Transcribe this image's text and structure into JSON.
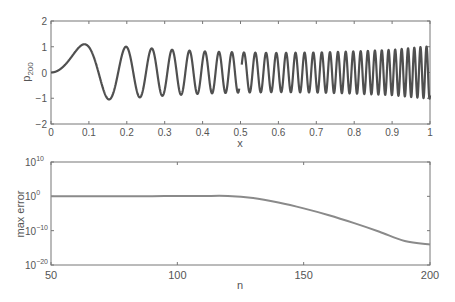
{
  "chart_data": [
    {
      "type": "line",
      "title": "",
      "xlabel": "x",
      "ylabel": "p",
      "ylabel_subscript": "200",
      "xlim": [
        0,
        1
      ],
      "ylim": [
        -2,
        2
      ],
      "grid": false,
      "xticks": [
        "0",
        "0.1",
        "0.2",
        "0.3",
        "0.4",
        "0.5",
        "0.6",
        "0.7",
        "0.8",
        "0.9",
        "1"
      ],
      "yticks": [
        "-2",
        "-1",
        "0",
        "1",
        "2"
      ],
      "series": [
        {
          "name": "p_200",
          "description": "oscillatory function, approx A(x)*sin(200 x^2), small gap near x=0.5",
          "phase_coefficient": 200,
          "envelope": {
            "x": [
              0,
              0.085,
              0.15,
              0.2,
              0.3,
              0.4,
              0.5,
              0.6,
              0.7,
              0.8,
              0.9,
              0.97,
              1.0
            ],
            "amplitude": [
              1.1,
              1.1,
              1.05,
              1.0,
              0.9,
              0.82,
              0.78,
              0.76,
              0.78,
              0.82,
              0.88,
              0.98,
              1.02
            ]
          },
          "color": "#505050"
        }
      ]
    },
    {
      "type": "line",
      "title": "",
      "xlabel": "n",
      "ylabel": "max error",
      "xlim": [
        50,
        200
      ],
      "ylim_log10": [
        -20,
        10
      ],
      "yscale": "log",
      "grid": false,
      "xticks": [
        "50",
        "100",
        "150",
        "200"
      ],
      "yticks": [
        {
          "base": "10",
          "exp": "10"
        },
        {
          "base": "10",
          "exp": "0"
        },
        {
          "base": "10",
          "exp": "-10"
        },
        {
          "base": "10",
          "exp": "-20"
        }
      ],
      "series": [
        {
          "name": "max error",
          "x": [
            50,
            60,
            70,
            80,
            90,
            100,
            110,
            120,
            130,
            140,
            150,
            160,
            170,
            180,
            190,
            200
          ],
          "log10_y": [
            0,
            0,
            0,
            0.05,
            0.05,
            0.1,
            0.1,
            0.1,
            -0.5,
            -1.8,
            -3.5,
            -5.5,
            -7.8,
            -10.3,
            -13.0,
            -14.0
          ],
          "color": "#8a8a8a"
        }
      ]
    }
  ]
}
